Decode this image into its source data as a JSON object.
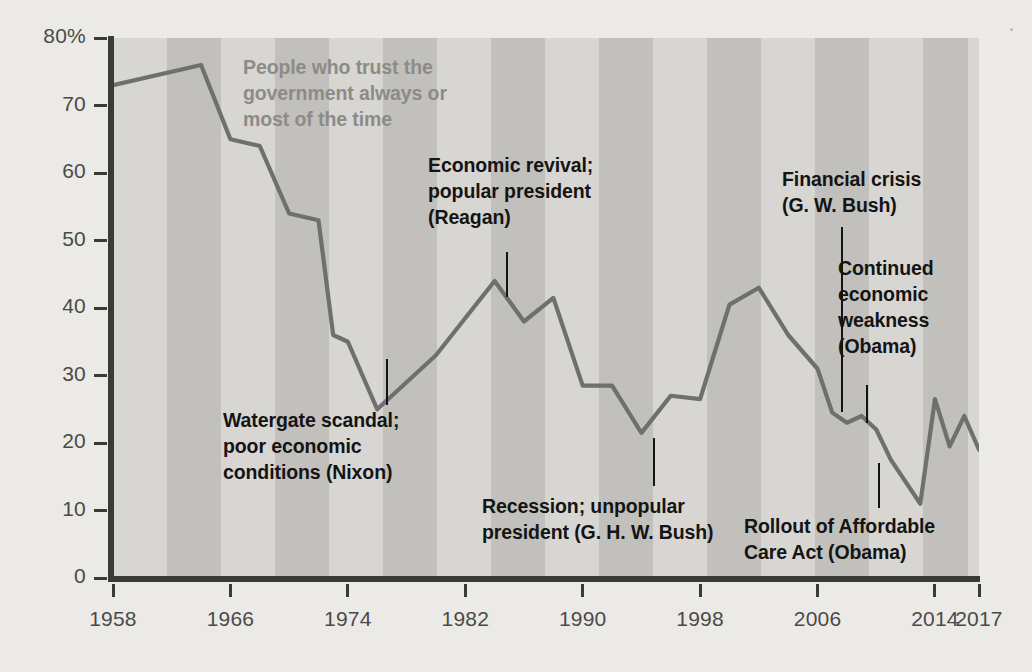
{
  "chart_data": {
    "type": "line",
    "title": "People who trust the government always or most of the time",
    "xlabel": "",
    "ylabel": "",
    "xlim": [
      1958,
      2017
    ],
    "ylim": [
      0,
      80
    ],
    "grid": false,
    "legend_position": "none",
    "y_ticks": [
      "80%",
      "70",
      "60",
      "50",
      "40",
      "30",
      "20",
      "10",
      "0"
    ],
    "y_tick_values": [
      80,
      70,
      60,
      50,
      40,
      30,
      20,
      10,
      0
    ],
    "x_ticks": [
      "1958",
      "1966",
      "1974",
      "1982",
      "1990",
      "1998",
      "2006",
      "2014",
      "2017"
    ],
    "x_tick_values": [
      1958,
      1966,
      1974,
      1982,
      1990,
      1998,
      2006,
      2014,
      2017
    ],
    "series": [
      {
        "name": "People who trust the government always or most of the time",
        "color": "#6f6f6d",
        "x": [
          1958,
          1964,
          1966,
          1968,
          1970,
          1972,
          1973,
          1974,
          1976,
          1980,
          1984,
          1986,
          1988,
          1990,
          1992,
          1994,
          1996,
          1998,
          2000,
          2002,
          2004,
          2006,
          2007,
          2008,
          2009,
          2010,
          2011,
          2013,
          2014,
          2015,
          2016,
          2017
        ],
        "values": [
          73,
          76,
          65,
          64,
          54,
          53,
          36,
          35,
          25,
          33,
          44,
          38,
          41.5,
          28.5,
          28.5,
          21.5,
          27,
          26.5,
          40.5,
          43,
          36,
          31,
          24.5,
          23,
          24,
          22,
          17.5,
          11,
          26.5,
          19.5,
          24,
          19
        ]
      }
    ],
    "annotations": [
      {
        "id": "series-label",
        "text_lines": [
          "People who trust the",
          "government always or",
          "most of the time"
        ],
        "style": "gray"
      },
      {
        "id": "watergate",
        "text_lines": [
          "Watergate scandal;",
          "poor economic",
          "conditions (Nixon)"
        ],
        "style": "black",
        "points_to_year": 1974
      },
      {
        "id": "reagan",
        "text_lines": [
          "Economic revival;",
          "popular president",
          "(Reagan)"
        ],
        "style": "black",
        "points_to_year": 1984
      },
      {
        "id": "ghw-bush",
        "text_lines": [
          "Recession; unpopular",
          "president (G. H. W. Bush)"
        ],
        "style": "black",
        "points_to_year": 1994
      },
      {
        "id": "financial-crisis",
        "text_lines": [
          "Financial crisis",
          "(G. W. Bush)"
        ],
        "style": "black",
        "points_to_year": 2007
      },
      {
        "id": "continued-weakness",
        "text_lines": [
          "Continued",
          "economic",
          "weakness",
          "(Obama)"
        ],
        "style": "black",
        "points_to_year": 2008
      },
      {
        "id": "aca-rollout",
        "text_lines": [
          "Rollout of Affordable",
          "Care Act (Obama)"
        ],
        "style": "black",
        "points_to_year": 2013
      }
    ]
  },
  "axis": {
    "y_labels": [
      "80%",
      "70",
      "60",
      "50",
      "40",
      "30",
      "20",
      "10",
      "0"
    ],
    "x_labels": [
      "1958",
      "1966",
      "1974",
      "1982",
      "1990",
      "1998",
      "2006",
      "2014",
      "2017"
    ]
  },
  "annotations": {
    "series_label": {
      "l1": "People who trust the",
      "l2": "government always or",
      "l3": "most of the time"
    },
    "watergate": {
      "l1": "Watergate scandal;",
      "l2": "poor economic",
      "l3": "conditions (Nixon)"
    },
    "reagan": {
      "l1": "Economic revival;",
      "l2": "popular president",
      "l3": "(Reagan)"
    },
    "ghw_bush": {
      "l1": "Recession; unpopular",
      "l2": "president (G. H. W. Bush)"
    },
    "financial_crisis": {
      "l1": "Financial crisis",
      "l2": "(G. W. Bush)"
    },
    "continued_weakness": {
      "l1": "Continued",
      "l2": "economic",
      "l3": "weakness",
      "l4": "(Obama)"
    },
    "aca_rollout": {
      "l1": "Rollout of Affordable",
      "l2": "Care Act (Obama)"
    }
  },
  "colors": {
    "line": "#6f6f6d",
    "plot_background_light": "#d8d6d2",
    "plot_background_dark": "#c2c0bc",
    "page_background": "#eceae6",
    "axis": "#3a3a38",
    "annotation_text": "#141414",
    "series_label_text": "#8d8b88",
    "tick_text": "#4a4a4a"
  }
}
